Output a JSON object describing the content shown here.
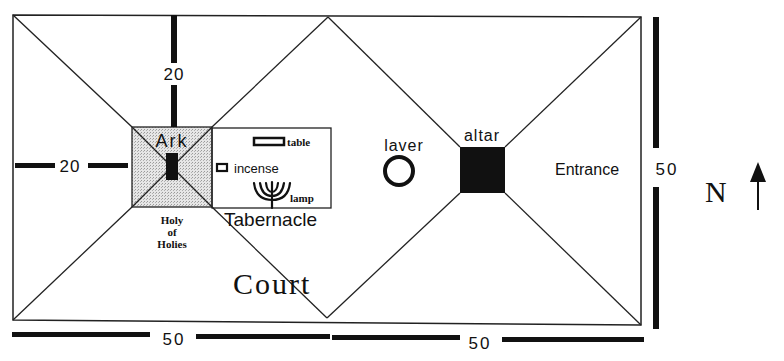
{
  "colors": {
    "ink": "#111111",
    "holy_of_holies_fill": "#d8d8d8",
    "background": "#ffffff"
  },
  "labels": {
    "ark": "Ark",
    "table": "table",
    "incense": "incense",
    "lamp": "lamp",
    "holy_of_holies_line1": "Holy",
    "holy_of_holies_line2": "of",
    "holy_of_holies_line3": "Holies",
    "tabernacle": "Tabernacle",
    "laver": "laver",
    "altar": "altar",
    "entrance": "Entrance",
    "court": "Court",
    "north": "N"
  },
  "dimensions": {
    "vertical_top": "20",
    "horizontal_left": "20",
    "bottom_left": "50",
    "bottom_right": "50",
    "right_side": "50"
  },
  "icons": {
    "ark": "filled-rectangle",
    "table": "hollow-rectangle",
    "incense": "hollow-square",
    "lamp": "menorah",
    "laver": "ring",
    "altar": "filled-square",
    "north_arrow": "arrow-up"
  }
}
